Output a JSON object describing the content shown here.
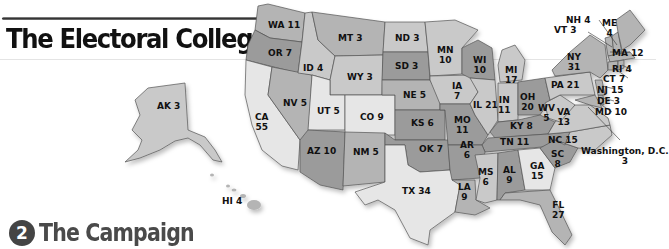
{
  "header": {
    "title": "The Electoral College"
  },
  "section": {
    "number": "2",
    "title": "The Campaign"
  },
  "colors": {
    "dark": "#9b9b9b",
    "mid": "#b4b4b4",
    "light": "#c9c9c9",
    "pale": "#e6e6e6"
  },
  "states": [
    {
      "abbr": "WA",
      "votes": "11"
    },
    {
      "abbr": "OR",
      "votes": "7"
    },
    {
      "abbr": "ID",
      "votes": "4"
    },
    {
      "abbr": "MT",
      "votes": "3"
    },
    {
      "abbr": "ND",
      "votes": "3"
    },
    {
      "abbr": "MN",
      "votes": "10"
    },
    {
      "abbr": "WI",
      "votes": "10"
    },
    {
      "abbr": "MI",
      "votes": "17"
    },
    {
      "abbr": "SD",
      "votes": "3"
    },
    {
      "abbr": "WY",
      "votes": "3"
    },
    {
      "abbr": "NV",
      "votes": "5"
    },
    {
      "abbr": "CA",
      "votes": "55"
    },
    {
      "abbr": "UT",
      "votes": "5"
    },
    {
      "abbr": "CO",
      "votes": "9"
    },
    {
      "abbr": "NE",
      "votes": "5"
    },
    {
      "abbr": "IA",
      "votes": "7"
    },
    {
      "abbr": "IL",
      "votes": "21"
    },
    {
      "abbr": "IN",
      "votes": "11"
    },
    {
      "abbr": "OH",
      "votes": "20"
    },
    {
      "abbr": "PA",
      "votes": "21"
    },
    {
      "abbr": "NY",
      "votes": "31"
    },
    {
      "abbr": "VT",
      "votes": "3"
    },
    {
      "abbr": "NH",
      "votes": "4"
    },
    {
      "abbr": "ME",
      "votes": "4"
    },
    {
      "abbr": "MA",
      "votes": "12"
    },
    {
      "abbr": "RI",
      "votes": "4"
    },
    {
      "abbr": "CT",
      "votes": "7"
    },
    {
      "abbr": "NJ",
      "votes": "15"
    },
    {
      "abbr": "DE",
      "votes": "3"
    },
    {
      "abbr": "MD",
      "votes": "10"
    },
    {
      "abbr": "WV",
      "votes": "5"
    },
    {
      "abbr": "VA",
      "votes": "13"
    },
    {
      "abbr": "KS",
      "votes": "6"
    },
    {
      "abbr": "MO",
      "votes": "11"
    },
    {
      "abbr": "KY",
      "votes": "8"
    },
    {
      "abbr": "AZ",
      "votes": "10"
    },
    {
      "abbr": "NM",
      "votes": "5"
    },
    {
      "abbr": "OK",
      "votes": "7"
    },
    {
      "abbr": "AR",
      "votes": "6"
    },
    {
      "abbr": "TN",
      "votes": "11"
    },
    {
      "abbr": "NC",
      "votes": "15"
    },
    {
      "abbr": "SC",
      "votes": "8"
    },
    {
      "abbr": "TX",
      "votes": "34"
    },
    {
      "abbr": "LA",
      "votes": "9"
    },
    {
      "abbr": "MS",
      "votes": "6"
    },
    {
      "abbr": "AL",
      "votes": "9"
    },
    {
      "abbr": "GA",
      "votes": "15"
    },
    {
      "abbr": "FL",
      "votes": "27"
    },
    {
      "abbr": "AK",
      "votes": "3"
    },
    {
      "abbr": "HI",
      "votes": "4"
    }
  ],
  "dc": {
    "name": "Washington, D.C.",
    "votes": "3"
  },
  "labels": {
    "WA": "WA 11",
    "OR": "OR 7",
    "ID": "ID 4",
    "MT": "MT 3",
    "ND": "ND 3",
    "MN_a": "MN",
    "MN_b": "10",
    "WI_a": "WI",
    "WI_b": "10",
    "MI_a": "MI",
    "MI_b": "17",
    "SD": "SD 3",
    "WY": "WY 3",
    "NV": "NV 5",
    "CA_a": "CA",
    "CA_b": "55",
    "UT": "UT 5",
    "CO": "CO 9",
    "NE": "NE 5",
    "IA_a": "IA",
    "IA_b": "7",
    "IL": "IL 21",
    "IN_a": "IN",
    "IN_b": "11",
    "OH_a": "OH",
    "OH_b": "20",
    "PA": "PA 21",
    "NY_a": "NY",
    "NY_b": "31",
    "VT": "VT 3",
    "NH": "NH 4",
    "ME_a": "ME",
    "ME_b": "4",
    "MA": "MA 12",
    "RI": "RI 4",
    "CT": "CT 7",
    "NJ": "NJ 15",
    "DE": "DE 3",
    "MD": "MD 10",
    "WV_a": "WV",
    "WV_b": "5",
    "VA_a": "VA",
    "VA_b": "13",
    "KS": "KS 6",
    "MO_a": "MO",
    "MO_b": "11",
    "KY": "KY 8",
    "AZ": "AZ 10",
    "NM": "NM 5",
    "OK": "OK 7",
    "AR_a": "AR",
    "AR_b": "6",
    "TN": "TN 11",
    "NC": "NC 15",
    "SC_a": "SC",
    "SC_b": "8",
    "TX": "TX 34",
    "LA_a": "LA",
    "LA_b": "9",
    "MS_a": "MS",
    "MS_b": "6",
    "AL_a": "AL",
    "AL_b": "9",
    "GA_a": "GA",
    "GA_b": "15",
    "FL_a": "FL",
    "FL_b": "27",
    "AK": "AK 3",
    "HI": "HI 4",
    "DC_a": "Washington, D.C.",
    "DC_b": "3"
  }
}
